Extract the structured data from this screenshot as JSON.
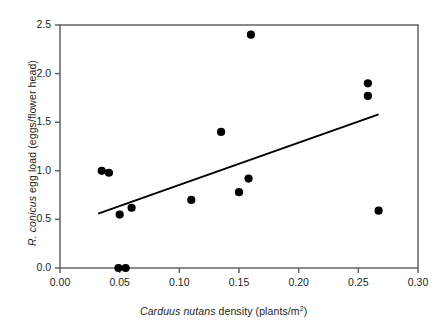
{
  "chart_data": {
    "type": "scatter",
    "title": "",
    "xlabel": "Carduus nutans density (plants/m2)",
    "ylabel": "R. conicus egg load (eggs/flower head)",
    "xlabel_parts": {
      "italic": "Carduus nutans",
      "rest": " density (plants/m",
      "superscript": "2",
      "tail": ")"
    },
    "ylabel_parts": {
      "italic": "R. conicus",
      "rest": " egg load (eggs/flower head)"
    },
    "xlim": [
      0.0,
      0.3
    ],
    "ylim": [
      0.0,
      2.5
    ],
    "xticks": [
      0.0,
      0.05,
      0.1,
      0.15,
      0.2,
      0.25,
      0.3
    ],
    "xtick_labels": [
      "0.00",
      "0.05",
      "0.10",
      "0.15",
      "0.20",
      "0.25",
      "0.30"
    ],
    "yticks": [
      0.0,
      0.5,
      1.0,
      1.5,
      2.0,
      2.5
    ],
    "ytick_labels": [
      "0.0",
      "0.5",
      "1.0",
      "1.5",
      "2.0",
      "2.5"
    ],
    "grid": false,
    "legend": false,
    "marker": "filled-circle",
    "marker_color": "#000000",
    "frame_color": "#58595b",
    "points": [
      {
        "x": 0.035,
        "y": 1.0
      },
      {
        "x": 0.041,
        "y": 0.98
      },
      {
        "x": 0.049,
        "y": 0.0
      },
      {
        "x": 0.055,
        "y": 0.0
      },
      {
        "x": 0.05,
        "y": 0.55
      },
      {
        "x": 0.06,
        "y": 0.62
      },
      {
        "x": 0.11,
        "y": 0.7
      },
      {
        "x": 0.135,
        "y": 1.4
      },
      {
        "x": 0.15,
        "y": 0.78
      },
      {
        "x": 0.158,
        "y": 0.92
      },
      {
        "x": 0.16,
        "y": 2.4
      },
      {
        "x": 0.258,
        "y": 1.9
      },
      {
        "x": 0.258,
        "y": 1.77
      },
      {
        "x": 0.267,
        "y": 0.59
      }
    ],
    "trendline": {
      "type": "linear-fit",
      "x0": 0.032,
      "y0": 0.56,
      "x1": 0.267,
      "y1": 1.58,
      "color": "#000000",
      "width": 2.0
    }
  }
}
